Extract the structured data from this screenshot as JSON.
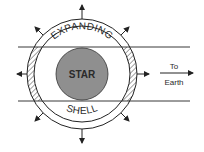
{
  "diagram": {
    "labels": {
      "star": "STAR",
      "shell_top": "EXPANDING",
      "shell_bottom": "SHELL",
      "direction_line1": "To",
      "direction_line2": "Earth"
    },
    "colors": {
      "background": "#ffffff",
      "stroke": "#222222",
      "star_fill": "#8f8f8f",
      "hatch": "#333333"
    },
    "elements": {
      "star": "gray filled circle at center",
      "shell": "expanding shell ring around star with hatched regions on left and right edges between sight lines",
      "sight_lines": "two horizontal parallel lines tangent to star extending toward Earth",
      "expansion_arrows": 8,
      "earth_arrow": "horizontal arrow pointing right labeled To Earth"
    }
  }
}
